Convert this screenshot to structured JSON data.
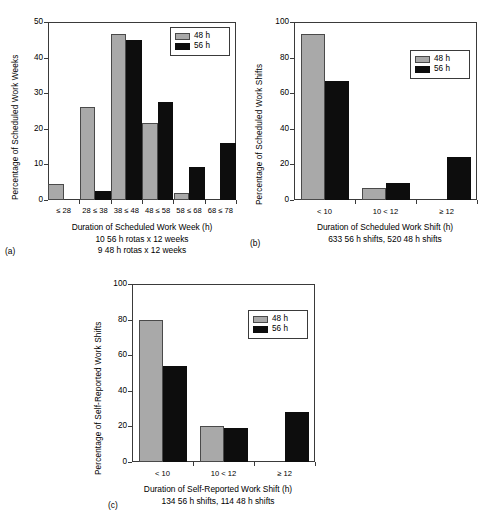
{
  "figure": {
    "series_names": [
      "48 h",
      "56 h"
    ],
    "colors": {
      "s48": "#a9a9a9",
      "s56": "#0d0d0d",
      "axis": "#3a3a3a"
    }
  },
  "chart_data": [
    {
      "type": "bar",
      "panel": "(a)",
      "title": "",
      "ylabel": "Percentage of Scheduled Work Weeks",
      "xlabel": "Duration of Scheduled Work Week (h)",
      "xlabel_line2": "10 56 h rotas x 12 weeks",
      "xlabel_line3": "9 48 h rotas x 12 weeks",
      "categories": [
        "≤ 28",
        "28 ≤ 38",
        "38 ≤ 48",
        "48 ≤ 58",
        "58 ≤ 68",
        "68 ≤ 78"
      ],
      "ylim": [
        0,
        50
      ],
      "yticks": [
        0,
        10,
        20,
        30,
        40,
        50
      ],
      "grid": false,
      "legend_position": "top-right",
      "series": [
        {
          "name": "48 h",
          "values": [
            4.6,
            26.0,
            46.5,
            21.5,
            2.1,
            0
          ]
        },
        {
          "name": "56 h",
          "values": [
            0,
            2.5,
            45.0,
            27.5,
            9.4,
            16.0
          ]
        }
      ]
    },
    {
      "type": "bar",
      "panel": "(b)",
      "title": "",
      "ylabel": "Percentage of Scheduled Work Shifts",
      "xlabel": "Duration of Scheduled Work Shift (h)",
      "xlabel_line2": "633 56 h shifts, 520 48 h shifts",
      "xlabel_line3": "",
      "categories": [
        "< 10",
        "10 < 12",
        "≥ 12"
      ],
      "ylim": [
        0,
        100
      ],
      "yticks": [
        0,
        20,
        40,
        60,
        80,
        100
      ],
      "grid": false,
      "legend_position": "top-right",
      "series": [
        {
          "name": "48 h",
          "values": [
            93.5,
            7.0,
            0
          ]
        },
        {
          "name": "56 h",
          "values": [
            66.8,
            9.5,
            24.2
          ]
        }
      ]
    },
    {
      "type": "bar",
      "panel": "(c)",
      "title": "",
      "ylabel": "Percentage of Self-Reported Work Shifts",
      "xlabel": "Duration of Self-Reported Work Shift (h)",
      "xlabel_line2": "134 56 h shifts, 114 48 h shifts",
      "xlabel_line3": "",
      "categories": [
        "< 10",
        "10 < 12",
        "≥ 12"
      ],
      "ylim": [
        0,
        100
      ],
      "yticks": [
        0,
        20,
        40,
        60,
        80,
        100
      ],
      "grid": false,
      "legend_position": "top-right",
      "series": [
        {
          "name": "48 h",
          "values": [
            80.0,
            20.5,
            0
          ]
        },
        {
          "name": "56 h",
          "values": [
            54.0,
            19.0,
            28.0
          ]
        }
      ]
    }
  ]
}
